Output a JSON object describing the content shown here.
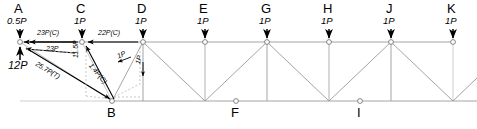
{
  "figure": {
    "type": "truss-free-body-diagram",
    "line_color": "#999999",
    "arrow_color": "#000000",
    "dash_color": "#bbbbbb"
  },
  "top_nodes": [
    {
      "letter": "A",
      "load": "0.5P",
      "x": 20,
      "y": 42
    },
    {
      "letter": "C",
      "load": "1P",
      "x": 82,
      "y": 42
    },
    {
      "letter": "D",
      "load": "1P",
      "x": 143,
      "y": 42
    },
    {
      "letter": "E",
      "load": "1P",
      "x": 205,
      "y": 42
    },
    {
      "letter": "G",
      "load": "1P",
      "x": 267,
      "y": 42
    },
    {
      "letter": "H",
      "load": "1P",
      "x": 329,
      "y": 42
    },
    {
      "letter": "J",
      "load": "1P",
      "x": 391,
      "y": 42
    },
    {
      "letter": "K",
      "load": "1P",
      "x": 453,
      "y": 42
    }
  ],
  "bottom_nodes": [
    {
      "letter": "B",
      "x": 112,
      "y": 101
    },
    {
      "letter": "F",
      "x": 236,
      "y": 101
    },
    {
      "letter": "I",
      "x": 360,
      "y": 101
    }
  ],
  "force_labels": {
    "reaction_a": "12P",
    "chord_ac": "23P(C)",
    "chord_cd": "22P(C)",
    "chord_ab_component": "23P",
    "diagonal_ab": "25.7P(T)",
    "vertical_cb_component": "11.5P",
    "diagonal_cb": "1.4P(C)",
    "small_unit_1": "1P",
    "small_unit_2": "1P"
  }
}
